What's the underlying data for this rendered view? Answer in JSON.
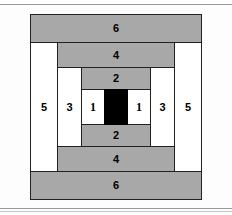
{
  "figure": {
    "colors": {
      "gray": "#a8a8a8",
      "white": "#ffffff",
      "black": "#000000",
      "outline": "#222222"
    },
    "rings": {
      "r6_top": "6",
      "r6_bottom": "6",
      "r5_left": "5",
      "r5_right": "5",
      "r4_top": "4",
      "r4_bottom": "4",
      "r3_left": "3",
      "r3_right": "3",
      "r2_top": "2",
      "r2_bottom": "2",
      "r1_left": "1",
      "r1_right": "1",
      "center": ""
    }
  }
}
